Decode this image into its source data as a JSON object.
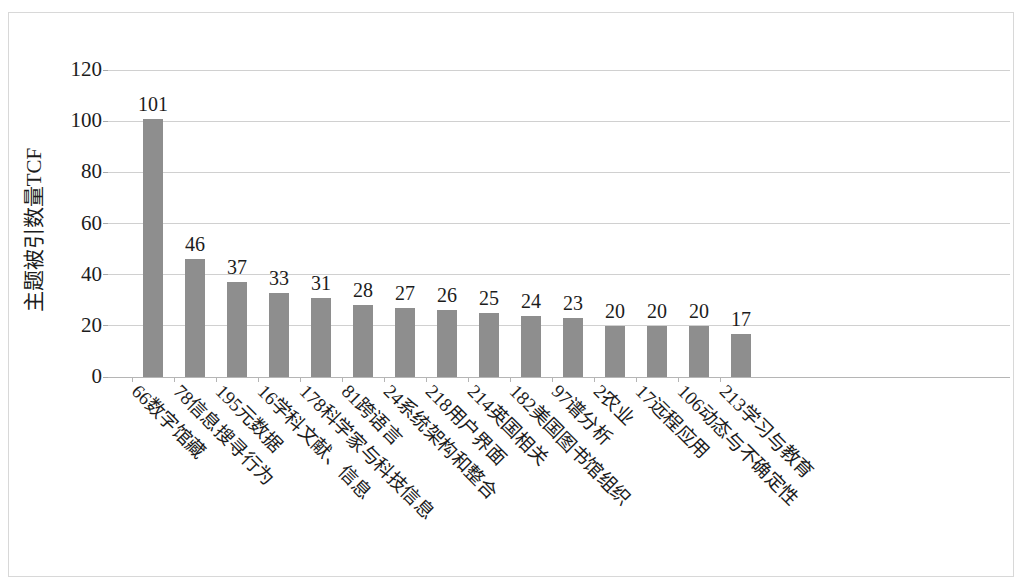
{
  "chart_data": {
    "type": "bar",
    "title": "",
    "subtitle": "",
    "xlabel": "",
    "ylabel": "主题被引数量TCF",
    "ylim": [
      0,
      120
    ],
    "ytick_step": 20,
    "yticks": [
      "120",
      "100",
      "80",
      "60",
      "40",
      "20",
      "0"
    ],
    "grid": true,
    "legend": false,
    "bar_color": "#8e8e8e",
    "categories": [
      "66数字馆藏",
      "78信息搜寻行为",
      "195元数据",
      "16学科文献、信息",
      "178科学家与科技信息",
      "81跨语言",
      "24系统架构和整合",
      "218用户界面",
      "214英国相关",
      "182美国图书馆组织",
      "97谱分析",
      "2农业",
      "17远程应用",
      "106动态与不确定性",
      "213学习与教育"
    ],
    "values": [
      101,
      46,
      37,
      33,
      31,
      28,
      27,
      26,
      25,
      24,
      23,
      20,
      20,
      20,
      17
    ],
    "value_labels": [
      "101",
      "46",
      "37",
      "33",
      "31",
      "28",
      "27",
      "26",
      "25",
      "24",
      "23",
      "20",
      "20",
      "20",
      "17"
    ]
  }
}
